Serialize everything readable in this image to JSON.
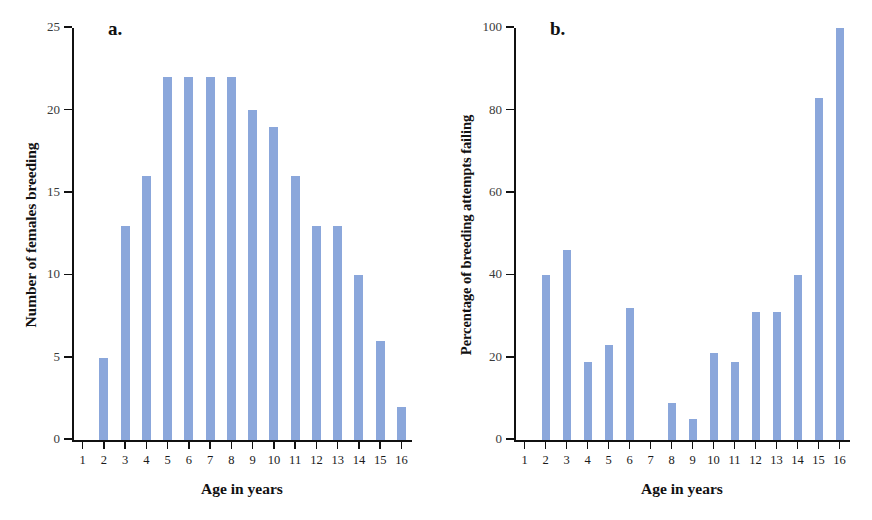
{
  "figure": {
    "background": "#ffffff",
    "bar_color": "#8ba7db",
    "axis_color": "#111111",
    "caption_partial": ""
  },
  "panels": [
    {
      "letter": "a.",
      "xlabel": "Age in years",
      "ylabel": "Number of females breeding"
    },
    {
      "letter": "b.",
      "xlabel": "Age in years",
      "ylabel": "Percentage of breeding attempts failing"
    }
  ],
  "chart_data": [
    {
      "type": "bar",
      "title": "a.",
      "xlabel": "Age in years",
      "ylabel": "Number of females breeding",
      "categories": [
        "1",
        "2",
        "3",
        "4",
        "5",
        "6",
        "7",
        "8",
        "9",
        "10",
        "11",
        "12",
        "13",
        "14",
        "15",
        "16"
      ],
      "values": [
        0,
        5,
        13,
        16,
        22,
        22,
        22,
        22,
        20,
        19,
        16,
        13,
        13,
        10,
        6,
        2
      ],
      "ylim": [
        0,
        25
      ],
      "yticks": [
        0,
        5,
        10,
        15,
        20,
        25
      ],
      "ytick_labels": [
        "0",
        "5",
        "10",
        "15",
        "20",
        "25"
      ],
      "grid": false,
      "legend": null
    },
    {
      "type": "bar",
      "title": "b.",
      "xlabel": "Age in years",
      "ylabel": "Percentage of breeding attempts failing",
      "categories": [
        "1",
        "2",
        "3",
        "4",
        "5",
        "6",
        "7",
        "8",
        "9",
        "10",
        "11",
        "12",
        "13",
        "14",
        "15",
        "16"
      ],
      "values": [
        0,
        40,
        46,
        19,
        23,
        32,
        0,
        9,
        5,
        21,
        19,
        31,
        31,
        40,
        83,
        100
      ],
      "ylim": [
        0,
        100
      ],
      "yticks": [
        0,
        20,
        40,
        60,
        80,
        100
      ],
      "ytick_labels": [
        "0",
        "20",
        "40",
        "60",
        "80",
        "100"
      ],
      "grid": false,
      "legend": null
    }
  ]
}
